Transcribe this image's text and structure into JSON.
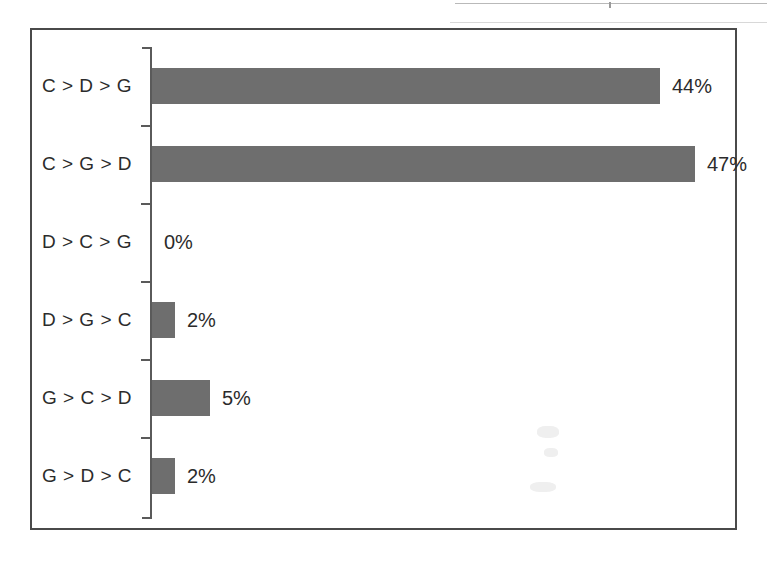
{
  "chart_data": {
    "type": "bar",
    "orientation": "horizontal",
    "title": "",
    "xlabel": "",
    "ylabel": "",
    "categories": [
      "C > D > G",
      "C > G > D",
      "D > C > G",
      "D > G > C",
      "G > C > D",
      "G > D > C"
    ],
    "values": [
      44,
      47,
      0,
      2,
      5,
      2
    ],
    "value_labels": [
      "44%",
      "47%",
      "0%",
      "2%",
      "5%",
      "2%"
    ],
    "xlim": [
      0,
      50
    ],
    "grid": false,
    "legend": null,
    "bar_color": "#6e6e6e",
    "axis_color": "#5a5a5a",
    "frame_color": "#4a4a4a",
    "text_color": "#2b2b2b"
  },
  "figure": {
    "background": "#ffffff"
  }
}
